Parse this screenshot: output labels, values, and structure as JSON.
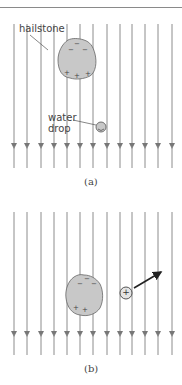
{
  "figure": {
    "panel_a": {
      "caption": "(a)",
      "labels": {
        "hailstone": "hailstone",
        "water_drop_line1": "water",
        "water_drop_line2": "drop"
      },
      "hailstone_charges": {
        "top": [
          "−",
          "−",
          "−"
        ],
        "bottom": [
          "+",
          "+",
          "+"
        ]
      },
      "drop_charge": ""
    },
    "panel_b": {
      "caption": "(b)",
      "hailstone_charges": {
        "top": [
          "−",
          "−",
          "−"
        ],
        "bottom": [
          "+",
          "+"
        ]
      },
      "drop_charge": "+"
    },
    "field_lines": {
      "count": 13,
      "direction": "down",
      "x_positions": [
        14,
        27,
        41,
        54,
        67,
        80,
        93,
        107,
        120,
        132,
        145,
        158,
        172
      ]
    },
    "colors": {
      "field_line": "#8c8c8c",
      "hailstone_fill": "#c8c8c8",
      "outline": "#666666",
      "arrow": "#222222"
    }
  }
}
